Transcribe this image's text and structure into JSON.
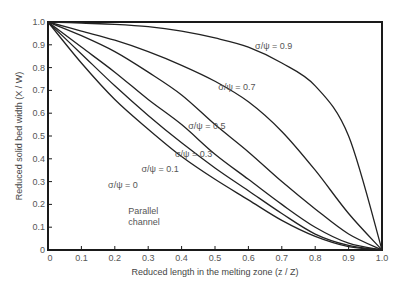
{
  "chart_data": {
    "type": "line",
    "title": "",
    "xlabel": "Reduced length in the melting zone (z / Z)",
    "ylabel": "Reduced solid bed width (X / W)",
    "xlim": [
      0,
      1.0
    ],
    "ylim": [
      0,
      1.0
    ],
    "grid": false,
    "x_ticks": [
      "0",
      "0.1",
      "0.2",
      "0.3",
      "0.4",
      "0.5",
      "0.6",
      "0.7",
      "0.8",
      "0.9",
      "1.0"
    ],
    "y_ticks": [
      "0",
      "0.1",
      "0.2",
      "0.3",
      "0.4",
      "0.5",
      "0.6",
      "0.7",
      "0.8",
      "0.9",
      "1.0"
    ],
    "x": [
      0,
      0.1,
      0.2,
      0.3,
      0.4,
      0.5,
      0.6,
      0.7,
      0.8,
      0.9,
      1.0
    ],
    "series": [
      {
        "name": "σ/ψ = 0.9",
        "values": [
          1.0,
          0.995,
          0.99,
          0.98,
          0.96,
          0.93,
          0.89,
          0.82,
          0.72,
          0.5,
          0.0
        ]
      },
      {
        "name": "σ/ψ = 0.7",
        "values": [
          1.0,
          0.96,
          0.92,
          0.87,
          0.81,
          0.74,
          0.65,
          0.52,
          0.35,
          0.16,
          0.0
        ]
      },
      {
        "name": "σ/ψ = 0.5",
        "values": [
          1.0,
          0.94,
          0.87,
          0.78,
          0.68,
          0.55,
          0.43,
          0.3,
          0.18,
          0.07,
          0.0
        ]
      },
      {
        "name": "σ/ψ = 0.3",
        "values": [
          1.0,
          0.89,
          0.78,
          0.66,
          0.55,
          0.42,
          0.31,
          0.2,
          0.1,
          0.03,
          0.0
        ]
      },
      {
        "name": "σ/ψ = 0.1",
        "values": [
          1.0,
          0.86,
          0.72,
          0.59,
          0.47,
          0.36,
          0.26,
          0.16,
          0.07,
          0.02,
          0.0
        ]
      },
      {
        "name": "σ/ψ = 0",
        "values": [
          1.0,
          0.82,
          0.66,
          0.53,
          0.41,
          0.31,
          0.22,
          0.13,
          0.06,
          0.015,
          0.0
        ]
      }
    ],
    "annotations": [
      {
        "text": "σ/ψ = 0.9",
        "x": 0.62,
        "y": 0.88
      },
      {
        "text": "σ/ψ = 0.7",
        "x": 0.51,
        "y": 0.7
      },
      {
        "text": "σ/ψ = 0.5",
        "x": 0.42,
        "y": 0.53
      },
      {
        "text": "σ/ψ = 0.3",
        "x": 0.38,
        "y": 0.41
      },
      {
        "text": "σ/ψ = 0.1",
        "x": 0.28,
        "y": 0.34
      },
      {
        "text": "σ/ψ = 0",
        "x": 0.18,
        "y": 0.27
      },
      {
        "text": "Parallel",
        "x": 0.24,
        "y": 0.16
      },
      {
        "text": "channel",
        "x": 0.24,
        "y": 0.11
      }
    ]
  }
}
